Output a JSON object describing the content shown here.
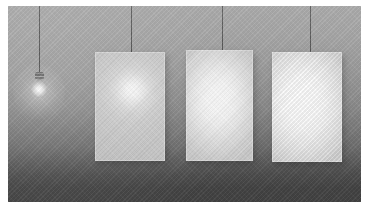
{
  "scene": {
    "title": "Light diffusion comparison render",
    "width": 369,
    "height": 208,
    "frame_color": "#ffffff",
    "background": {
      "name": "gradient-wall",
      "top_color": "#aeaeae",
      "mid_color": "#8b8b8b",
      "bottom_color": "#424242",
      "texture": "diagonal-weave"
    }
  },
  "lamp": {
    "name": "pendant-light-bulb",
    "label": "Bare bulb",
    "cord_x": 39,
    "cord_top": 0,
    "cord_bottom": 74,
    "cord_color": "#525252",
    "cap_y": 74,
    "glass_y": 81,
    "glow_color": "#ffffff",
    "state": "on"
  },
  "cords": [
    {
      "name": "cord-bulb",
      "x": 39,
      "length": 74
    },
    {
      "name": "cord-panel-1",
      "x": 131,
      "length": 52
    },
    {
      "name": "cord-panel-2",
      "x": 222,
      "length": 50
    },
    {
      "name": "cord-panel-3",
      "x": 310,
      "length": 52
    }
  ],
  "panels": [
    {
      "name": "panel-1",
      "label": "Panel 1",
      "diffusion": "narrow hotspot",
      "x": 95,
      "y": 52,
      "width": 70,
      "height": 109,
      "hotspot": {
        "cx": 37,
        "cy": 38,
        "radius": 34,
        "intensity": 1.0
      },
      "base_color": "#d2d2d2",
      "core_color": "#ffffff"
    },
    {
      "name": "panel-2",
      "label": "Panel 2",
      "diffusion": "medium spread",
      "x": 186,
      "y": 50,
      "width": 67,
      "height": 111,
      "hotspot": {
        "cx": 34,
        "cy": 48,
        "radius": 64,
        "intensity": 0.96
      },
      "base_color": "#d8d8d8",
      "core_color": "#ffffff"
    },
    {
      "name": "panel-3",
      "label": "Panel 3",
      "diffusion": "wide soft spread",
      "x": 272,
      "y": 52,
      "width": 70,
      "height": 110,
      "hotspot": {
        "cx": 32,
        "cy": 50,
        "radius": 70,
        "intensity": 0.92
      },
      "base_color": "#dadada",
      "core_color": "#ffffff"
    }
  ]
}
